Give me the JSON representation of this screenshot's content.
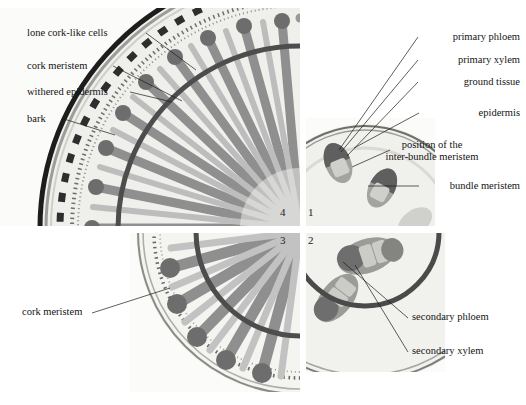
{
  "figure": {
    "panel_numbers": [
      "1",
      "2",
      "3",
      "4"
    ],
    "background_color": "#ffffff",
    "tissue_colors": {
      "xylem": "#8d8d8d",
      "phloem": "#6f6f6f",
      "ground_tissue": "#ebebe8",
      "epidermis": "#7a7a78",
      "cambium_ring": "#4a4a4a",
      "bark_outer": "#1f1f1f",
      "cork_meristem": "#3a3a3a",
      "ray": "#b9b9b9"
    }
  },
  "panels": [
    {
      "id": "panel-1",
      "number": "1",
      "position": "top-right",
      "caption_stage": "primary structure",
      "labels": [
        {
          "key": "primary_phloem",
          "text": "primary phloem"
        },
        {
          "key": "primary_xylem",
          "text": "primary xylem"
        },
        {
          "key": "ground_tissue",
          "text": "ground tissue"
        },
        {
          "key": "epidermis",
          "text": "epidermis"
        },
        {
          "key": "inter_bundle_meristem_l1",
          "text": "position of the"
        },
        {
          "key": "inter_bundle_meristem_l2",
          "text": "inter-bundle meristem"
        },
        {
          "key": "bundle_meristem",
          "text": "bundle meristem"
        }
      ]
    },
    {
      "id": "panel-2",
      "number": "2",
      "position": "bottom-right",
      "caption_stage": "early secondary growth",
      "labels": [
        {
          "key": "secondary_phloem",
          "text": "secondary phloem"
        },
        {
          "key": "secondary_xylem",
          "text": "secondary xylem"
        }
      ]
    },
    {
      "id": "panel-3",
      "number": "3",
      "position": "bottom-left",
      "caption_stage": "continuous cambial ring",
      "labels": [
        {
          "key": "cork_meristem",
          "text": "cork meristem"
        }
      ]
    },
    {
      "id": "panel-4",
      "number": "4",
      "position": "top-left",
      "caption_stage": "extensive secondary growth with bark",
      "labels": [
        {
          "key": "lone_cork_like_cells",
          "text": "lone cork-like cells"
        },
        {
          "key": "cork_meristem",
          "text": "cork meristem"
        },
        {
          "key": "withered_epidermis",
          "text": "withered epidermis"
        },
        {
          "key": "bark",
          "text": "bark"
        }
      ]
    }
  ]
}
